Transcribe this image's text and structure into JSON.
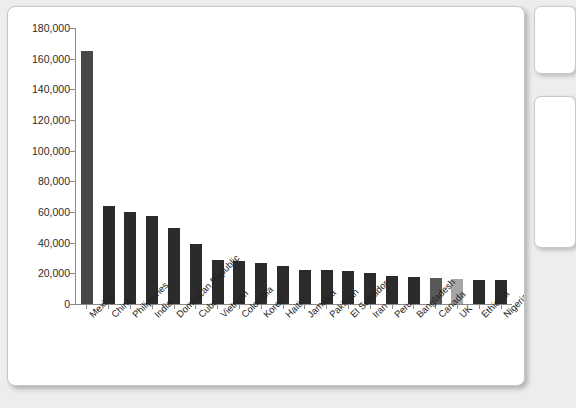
{
  "chart_data": {
    "type": "bar",
    "title": "",
    "subtitle": "",
    "xlabel": "",
    "ylabel": "",
    "ylim": [
      0,
      180000
    ],
    "ytick_step": 20000,
    "grid": false,
    "legend": "none",
    "ytick_labels": [
      "180,000",
      "160,000",
      "140,000",
      "120,000",
      "100,000",
      "80,000",
      "60,000",
      "40,000",
      "20,000",
      "0"
    ],
    "ytick_values": [
      180000,
      160000,
      140000,
      120000,
      100000,
      80000,
      60000,
      40000,
      20000,
      0
    ],
    "categories": [
      "Mexico",
      "China",
      "Philippines",
      "India",
      "Dominican Republic",
      "Cuba",
      "Vietnam",
      "Colombia",
      "Korea",
      "Haiti",
      "Jamaica",
      "Pakistan",
      "El Salvador",
      "Iran",
      "Peru",
      "Bangladesh",
      "Canada",
      "UK",
      "Ethiopia",
      "Nigeria"
    ],
    "values": [
      165000,
      64000,
      60000,
      57500,
      49500,
      39000,
      29000,
      28000,
      26500,
      25000,
      22500,
      22000,
      21800,
      20000,
      18500,
      17500,
      17000,
      16500,
      15800,
      15500
    ],
    "bar_colors": [
      "#484848",
      "#2b2b2b",
      "#2b2b2b",
      "#2b2b2b",
      "#2b2b2b",
      "#2b2b2b",
      "#2b2b2b",
      "#2b2b2b",
      "#2b2b2b",
      "#2b2b2b",
      "#2b2b2b",
      "#2b2b2b",
      "#2b2b2b",
      "#2b2b2b",
      "#2b2b2b",
      "#2b2b2b",
      "#595959",
      "#a6a6a6",
      "#2b2b2b",
      "#2b2b2b"
    ]
  }
}
